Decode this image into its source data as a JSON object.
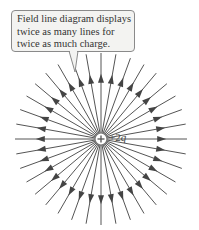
{
  "callout": {
    "lines": [
      "Field line diagram displays",
      "twice as many lines for",
      "twice as much charge."
    ]
  },
  "charge": {
    "sign": "+",
    "label_prefix": "+2",
    "label_symbol": "q",
    "center": [
      101,
      139
    ]
  },
  "field_lines": {
    "count": 36,
    "direction": "outward",
    "radius": 86,
    "color": "#555555"
  }
}
